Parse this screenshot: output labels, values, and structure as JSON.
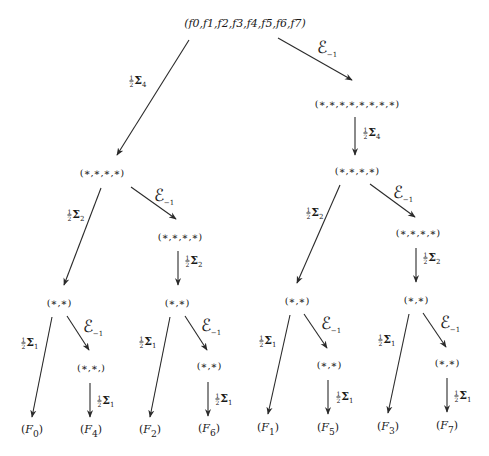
{
  "diagram": {
    "type": "binary-decomposition-tree",
    "root": {
      "label": "(f0,f1,f2,f3,f4,f5,f6,f7)"
    },
    "nodes": {
      "n8": "(∗,∗,∗,∗,∗,∗,∗,∗)",
      "n4_left": "(∗,∗,∗,∗)",
      "n4_right": "(∗,∗,∗,∗)",
      "n4_left_e": "(∗,∗,∗,∗)",
      "n4_right_e": "(∗,∗,∗,∗)",
      "n2_a": "(∗,∗)",
      "n2_b": "(∗,∗)",
      "n2_c": "(∗,∗)",
      "n2_d": "(∗,∗)",
      "n2_a_e": "(∗,∗,)",
      "n2_b_e": "(∗,∗)",
      "n2_c_e": "(∗,∗)",
      "n2_d_e": "(∗,∗)"
    },
    "leaves": [
      "(F0)",
      "(F4)",
      "(F2)",
      "(F6)",
      "(F1)",
      "(F5)",
      "(F3)",
      "(F7)"
    ],
    "leaf_parts": [
      {
        "base": "F",
        "sub": "0"
      },
      {
        "base": "F",
        "sub": "4"
      },
      {
        "base": "F",
        "sub": "2"
      },
      {
        "base": "F",
        "sub": "6"
      },
      {
        "base": "F",
        "sub": "1"
      },
      {
        "base": "F",
        "sub": "5"
      },
      {
        "base": "F",
        "sub": "3"
      },
      {
        "base": "F",
        "sub": "7"
      }
    ],
    "labels": {
      "half_num": "1",
      "half_den": "2",
      "sigma": "Σ",
      "sigma4_sub": "4",
      "sigma2_sub": "2",
      "sigma1_sub": "1",
      "eps": "ℰ",
      "eps_sub": "−1"
    },
    "edges": [
      {
        "from": "root",
        "to": "n4_left",
        "label": "½Σ4"
      },
      {
        "from": "root",
        "to": "n8",
        "label": "ℰ−1"
      },
      {
        "from": "n8",
        "to": "n4_right",
        "label": "½Σ4"
      },
      {
        "from": "n4_left",
        "to": "n2_a",
        "label": "½Σ2"
      },
      {
        "from": "n4_left",
        "to": "n4_left_e",
        "label": "ℰ−1"
      },
      {
        "from": "n4_left_e",
        "to": "n2_b",
        "label": "½Σ2"
      },
      {
        "from": "n4_right",
        "to": "n2_c",
        "label": "½Σ2"
      },
      {
        "from": "n4_right",
        "to": "n4_right_e",
        "label": "ℰ−1"
      },
      {
        "from": "n4_right_e",
        "to": "n2_d",
        "label": "½Σ2"
      },
      {
        "from": "n2_a",
        "to": "F0",
        "label": "½Σ1"
      },
      {
        "from": "n2_a",
        "to": "n2_a_e",
        "label": "ℰ−1"
      },
      {
        "from": "n2_a_e",
        "to": "F4",
        "label": "½Σ1"
      },
      {
        "from": "n2_b",
        "to": "F2",
        "label": "½Σ1"
      },
      {
        "from": "n2_b",
        "to": "n2_b_e",
        "label": "ℰ−1"
      },
      {
        "from": "n2_b_e",
        "to": "F6",
        "label": "½Σ1"
      },
      {
        "from": "n2_c",
        "to": "F1",
        "label": "½Σ1"
      },
      {
        "from": "n2_c",
        "to": "n2_c_e",
        "label": "ℰ−1"
      },
      {
        "from": "n2_c_e",
        "to": "F5",
        "label": "½Σ1"
      },
      {
        "from": "n2_d",
        "to": "F3",
        "label": "½Σ1"
      },
      {
        "from": "n2_d",
        "to": "n2_d_e",
        "label": "ℰ−1"
      },
      {
        "from": "n2_d_e",
        "to": "F7",
        "label": "½Σ1"
      }
    ]
  }
}
